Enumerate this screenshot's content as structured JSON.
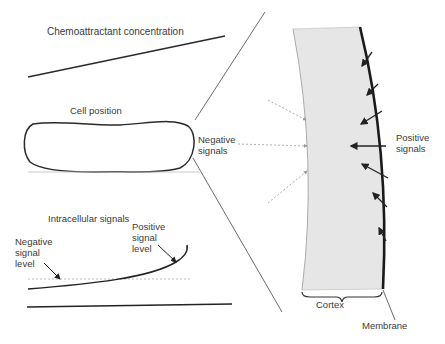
{
  "diagram": {
    "left_panel": {
      "top_graph": {
        "title": "Chemoattractant concentration"
      },
      "middle_graph": {
        "title": "Cell position"
      },
      "bottom_graph": {
        "title": "Intracellular signals",
        "annotations": {
          "positive": "Positive\nsignal\nlevel",
          "negative": "Negative\nsignal\nlevel"
        }
      }
    },
    "right_panel": {
      "negative_label": "Negative\nsignals",
      "positive_label": "Positive\nsignals",
      "cortex_label": "Cortex",
      "membrane_label": "Membrane"
    },
    "colors": {
      "line": "#2a2a2a",
      "cortex_fill": "#e6e6e6",
      "dashed": "#aaaaaa"
    }
  }
}
